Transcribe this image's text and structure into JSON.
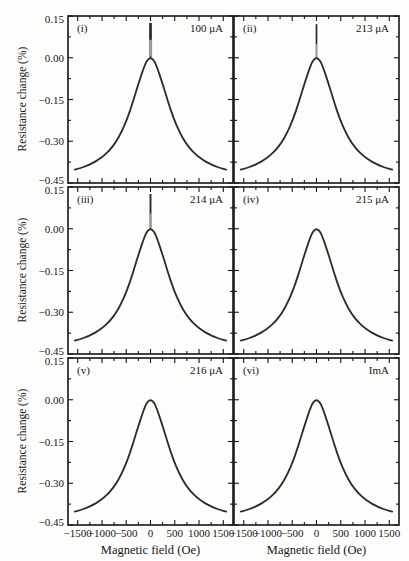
{
  "figure": {
    "colors": {
      "background": "#fdfdfb",
      "frame": "#161616",
      "curve": "#2d2a27",
      "spike_gray": "#9a9a9a",
      "text": "#161616"
    }
  },
  "chart_data": {
    "type": "line",
    "title": "",
    "xlabel": "Magnetic field (Oe)",
    "ylabel": "Resistance change (%)",
    "xlim": [
      -1700,
      1700
    ],
    "ylim": [
      -0.45,
      0.15
    ],
    "x_ticks": [
      -1500,
      -1000,
      -500,
      0,
      500,
      1000,
      1500
    ],
    "x_tick_labels": [
      "−1500",
      "−1000",
      "−500",
      "0",
      "500",
      "1000",
      "1500"
    ],
    "x_minor_ticks": [
      -1250,
      -750,
      -250,
      250,
      750,
      1250
    ],
    "y_ticks": [
      0.15,
      0.0,
      -0.15,
      -0.3,
      -0.45
    ],
    "y_tick_labels": [
      "0.15",
      "0.00",
      "−0.15",
      "−0.30",
      "−0.45"
    ],
    "y_minor_ticks": [
      0.075,
      -0.075,
      -0.225,
      -0.375
    ],
    "grid": false,
    "layout": "2 columns x 3 rows, shared axes, peak centered at 0 Oe with resistance change 0%",
    "x": [
      -1560,
      -1440,
      -1320,
      -1200,
      -1080,
      -960,
      -840,
      -720,
      -600,
      -480,
      -360,
      -240,
      -120,
      -60,
      0,
      60,
      120,
      240,
      360,
      480,
      600,
      720,
      840,
      960,
      1080,
      1200,
      1320,
      1440,
      1560
    ],
    "series": [
      {
        "panel": "(i)",
        "label": "100 μA",
        "spike": {
          "top": 0.125,
          "gray_to": 0.065,
          "w": 3.2
        },
        "values": [
          -0.402,
          -0.396,
          -0.389,
          -0.379,
          -0.367,
          -0.352,
          -0.332,
          -0.305,
          -0.268,
          -0.22,
          -0.158,
          -0.088,
          -0.026,
          -0.007,
          0.0,
          -0.007,
          -0.026,
          -0.088,
          -0.158,
          -0.22,
          -0.268,
          -0.305,
          -0.332,
          -0.352,
          -0.367,
          -0.379,
          -0.389,
          -0.396,
          -0.402
        ]
      },
      {
        "panel": "(ii)",
        "label": "213 μA",
        "spike": {
          "top": 0.12,
          "gray_to": 0.05,
          "w": 1.5
        },
        "values": [
          -0.402,
          -0.396,
          -0.389,
          -0.379,
          -0.367,
          -0.352,
          -0.332,
          -0.305,
          -0.268,
          -0.22,
          -0.158,
          -0.088,
          -0.026,
          -0.007,
          0.0,
          -0.007,
          -0.026,
          -0.088,
          -0.158,
          -0.22,
          -0.268,
          -0.305,
          -0.332,
          -0.352,
          -0.367,
          -0.379,
          -0.389,
          -0.396,
          -0.402
        ]
      },
      {
        "panel": "(iii)",
        "label": "214 μA",
        "spike": {
          "top": 0.125,
          "gray_to": 0.055,
          "w": 2.2
        },
        "values": [
          -0.402,
          -0.396,
          -0.389,
          -0.379,
          -0.367,
          -0.352,
          -0.332,
          -0.305,
          -0.268,
          -0.22,
          -0.158,
          -0.088,
          -0.026,
          -0.007,
          0.0,
          -0.007,
          -0.026,
          -0.088,
          -0.158,
          -0.22,
          -0.268,
          -0.305,
          -0.332,
          -0.352,
          -0.367,
          -0.379,
          -0.389,
          -0.396,
          -0.402
        ]
      },
      {
        "panel": "(iv)",
        "label": "215 μA",
        "spike": null,
        "values": [
          -0.402,
          -0.396,
          -0.389,
          -0.379,
          -0.367,
          -0.352,
          -0.332,
          -0.305,
          -0.268,
          -0.22,
          -0.158,
          -0.088,
          -0.026,
          -0.007,
          0.0,
          -0.007,
          -0.026,
          -0.088,
          -0.158,
          -0.22,
          -0.268,
          -0.305,
          -0.332,
          -0.352,
          -0.367,
          -0.379,
          -0.389,
          -0.396,
          -0.402
        ]
      },
      {
        "panel": "(v)",
        "label": "216 μA",
        "spike": null,
        "values": [
          -0.402,
          -0.396,
          -0.389,
          -0.379,
          -0.367,
          -0.352,
          -0.332,
          -0.305,
          -0.268,
          -0.22,
          -0.158,
          -0.088,
          -0.026,
          -0.007,
          0.0,
          -0.007,
          -0.026,
          -0.088,
          -0.158,
          -0.22,
          -0.268,
          -0.305,
          -0.332,
          -0.352,
          -0.367,
          -0.379,
          -0.389,
          -0.396,
          -0.402
        ]
      },
      {
        "panel": "(vi)",
        "label": "ImA",
        "spike": null,
        "values": [
          -0.402,
          -0.396,
          -0.389,
          -0.379,
          -0.367,
          -0.352,
          -0.332,
          -0.305,
          -0.268,
          -0.22,
          -0.158,
          -0.088,
          -0.026,
          -0.007,
          0.0,
          -0.007,
          -0.026,
          -0.088,
          -0.158,
          -0.22,
          -0.268,
          -0.305,
          -0.332,
          -0.352,
          -0.367,
          -0.379,
          -0.389,
          -0.396,
          -0.402
        ]
      }
    ]
  }
}
